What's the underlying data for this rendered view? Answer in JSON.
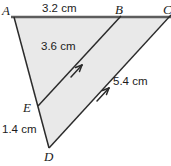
{
  "figure": {
    "kind": "geometry-diagram",
    "shape": "triangle",
    "fill_color": "#e9e9e9",
    "stroke_color": "#2b2b2b",
    "top_edge_color": "#5a5a5a",
    "background_color": "#ffffff",
    "vertices": [
      {
        "id": "A",
        "label": "A",
        "x": 14,
        "y": 17
      },
      {
        "id": "B",
        "label": "B",
        "x": 119,
        "y": 17
      },
      {
        "id": "C",
        "label": "C",
        "x": 168,
        "y": 17
      },
      {
        "id": "D",
        "label": "D",
        "x": 49,
        "y": 148
      },
      {
        "id": "E",
        "label": "E",
        "x": 38,
        "y": 106
      }
    ],
    "measures": [
      {
        "id": "AB",
        "label": "3.2 cm",
        "value": 3.2,
        "unit": "cm",
        "segment": "A-B"
      },
      {
        "id": "EB",
        "label": "3.6 cm",
        "value": 3.6,
        "unit": "cm",
        "segment": "E-B"
      },
      {
        "id": "DC",
        "label": "5.4 cm",
        "value": 5.4,
        "unit": "cm",
        "segment": "D-C"
      },
      {
        "id": "ED",
        "label": "1.4 cm",
        "value": 1.4,
        "unit": "cm",
        "segment": "E-D"
      }
    ],
    "parallel_marks": [
      {
        "id": "EB",
        "on_segment": "E-B",
        "arrow_count": 1,
        "direction": "toward-B"
      },
      {
        "id": "DC",
        "on_segment": "D-C",
        "arrow_count": 1,
        "direction": "toward-C"
      }
    ]
  }
}
